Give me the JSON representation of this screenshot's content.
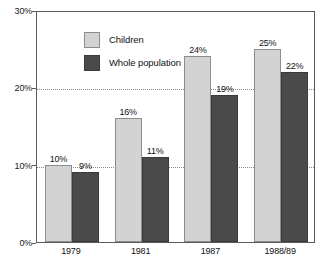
{
  "chart_data": {
    "type": "bar",
    "title": "",
    "xlabel": "",
    "ylabel": "",
    "categories": [
      "1979",
      "1981",
      "1987",
      "1988/89"
    ],
    "series": [
      {
        "name": "Children",
        "color": "#d3d3d3",
        "values": [
          10,
          16,
          24,
          25
        ],
        "labels": [
          "10%",
          "16%",
          "24%",
          "25%"
        ]
      },
      {
        "name": "Whole population",
        "color": "#4a4a4a",
        "values": [
          9,
          11,
          19,
          22
        ],
        "labels": [
          "9%",
          "11%",
          "19%",
          "22%"
        ]
      }
    ],
    "ylim": [
      0,
      30
    ],
    "yticks": [
      0,
      10,
      20,
      30
    ],
    "ytick_labels": [
      "0%",
      "10%",
      "20%",
      "30%"
    ],
    "grid": true,
    "gridlines_at": [
      10,
      20
    ],
    "legend_position": "top-left"
  },
  "axis": {
    "y": {
      "ticks": [
        {
          "value": 30,
          "label": "30%"
        },
        {
          "value": 20,
          "label": "20%"
        },
        {
          "value": 10,
          "label": "10%"
        },
        {
          "value": 0,
          "label": "0%"
        }
      ]
    },
    "x": {
      "ticks": [
        {
          "label": "1979"
        },
        {
          "label": "1981"
        },
        {
          "label": "1987"
        },
        {
          "label": "1988/89"
        }
      ]
    }
  },
  "legend": {
    "entries": [
      {
        "label": "Children",
        "color": "#d3d3d3"
      },
      {
        "label": "Whole population",
        "color": "#4a4a4a"
      }
    ]
  }
}
